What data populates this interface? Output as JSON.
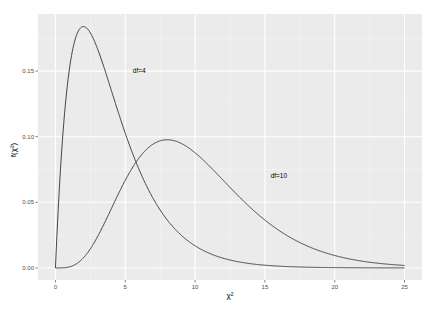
{
  "chart_data": {
    "type": "line",
    "title": "",
    "xlabel": "χ²",
    "ylabel": "f(χ²)",
    "xlim": [
      -1.25,
      26.25
    ],
    "ylim": [
      -0.0092,
      0.1935
    ],
    "x_ticks": [
      0,
      5,
      10,
      15,
      20,
      25
    ],
    "x_tick_labels": [
      "0",
      "5",
      "10",
      "15",
      "20",
      "25"
    ],
    "y_ticks": [
      0.0,
      0.05,
      0.1,
      0.15
    ],
    "y_tick_labels": [
      "0.00",
      "0.05",
      "0.10",
      "0.15"
    ],
    "grid": true,
    "minor_grid": true,
    "legend": "none",
    "x_range": [
      0,
      25
    ],
    "series": [
      {
        "name": "df=4",
        "df": 4,
        "color": "#333333",
        "peak": {
          "x": 2,
          "y": 0.184
        },
        "points": [
          [
            0,
            0
          ],
          [
            0.5,
            0.0974
          ],
          [
            1,
            0.1516
          ],
          [
            1.5,
            0.1771
          ],
          [
            2,
            0.1839
          ],
          [
            3,
            0.1673
          ],
          [
            4,
            0.1353
          ],
          [
            5,
            0.1026
          ],
          [
            6,
            0.0747
          ],
          [
            7,
            0.0528
          ],
          [
            8,
            0.0366
          ],
          [
            10,
            0.0168
          ],
          [
            12,
            0.0074
          ],
          [
            15,
            0.0021
          ],
          [
            20,
            0.0002
          ],
          [
            25,
            2e-05
          ]
        ]
      },
      {
        "name": "df=10",
        "df": 10,
        "color": "#333333",
        "peak": {
          "x": 8,
          "y": 0.0977
        },
        "points": [
          [
            0,
            0
          ],
          [
            2,
            0.0077
          ],
          [
            4,
            0.0451
          ],
          [
            6,
            0.084
          ],
          [
            8,
            0.0977
          ],
          [
            10,
            0.0877
          ],
          [
            12,
            0.0669
          ],
          [
            14,
            0.0457
          ],
          [
            16,
            0.0286
          ],
          [
            18,
            0.0167
          ],
          [
            20,
            0.0092
          ],
          [
            22,
            0.0049
          ],
          [
            25,
            0.0017
          ]
        ]
      }
    ],
    "annotations": [
      {
        "text": "df=4",
        "x": 6,
        "y": 0.15
      },
      {
        "text": "df=10",
        "x": 16,
        "y": 0.07
      }
    ],
    "colors": {
      "panel_background": "#EBEBEB",
      "grid_major": "#FFFFFF",
      "grid_minor": "#F5F5F5",
      "line": "#333333",
      "tick_text": "#4D4D4D"
    }
  }
}
